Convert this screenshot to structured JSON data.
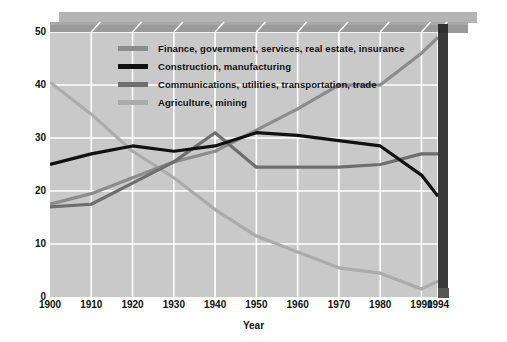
{
  "chart_data": {
    "type": "line",
    "title": "",
    "xlabel": "Year",
    "ylabel": "Percentage of U.S. work force",
    "xlim": [
      1900,
      1994
    ],
    "ylim": [
      0,
      50
    ],
    "grid": true,
    "legend_position": "upper-left-inside",
    "x_tick_labels": [
      "1900",
      "1910",
      "1920",
      "1930",
      "1940",
      "1950",
      "1960",
      "1970",
      "1980",
      "1990",
      "1994"
    ],
    "x_tick_values": [
      1900,
      1910,
      1920,
      1930,
      1940,
      1950,
      1960,
      1970,
      1980,
      1990,
      1994
    ],
    "y_tick_labels": [
      "0",
      "10",
      "20",
      "30",
      "40",
      "50"
    ],
    "y_tick_values": [
      0,
      10,
      20,
      30,
      40,
      50
    ],
    "x": [
      1900,
      1910,
      1920,
      1930,
      1940,
      1950,
      1960,
      1970,
      1980,
      1990,
      1994
    ],
    "series": [
      {
        "name": "Finance, government, services, real estate, insurance",
        "color": "#8c8c8c",
        "values": [
          17.5,
          19.5,
          22.5,
          25.5,
          27.5,
          31.5,
          35.5,
          40.0,
          40.0,
          46.0,
          49.0
        ]
      },
      {
        "name": "Construction, manufacturing",
        "color": "#111111",
        "values": [
          25.0,
          27.0,
          28.5,
          27.5,
          28.5,
          31.0,
          30.5,
          29.5,
          28.5,
          23.0,
          19.0
        ]
      },
      {
        "name": "Communications, utilities, transportation, trade",
        "color": "#6e6e6e",
        "values": [
          17.0,
          17.5,
          21.5,
          25.5,
          31.0,
          24.5,
          24.5,
          24.5,
          25.0,
          27.0,
          27.0
        ]
      },
      {
        "name": "Agriculture, mining",
        "color": "#ababab",
        "values": [
          40.5,
          34.5,
          27.5,
          22.5,
          16.5,
          11.5,
          8.5,
          5.5,
          4.5,
          1.5,
          3.0
        ]
      }
    ]
  },
  "legend": {
    "items": [
      {
        "label": "Finance, government, services, real estate, insurance",
        "color": "#8c8c8c"
      },
      {
        "label": "Construction, manufacturing",
        "color": "#111111"
      },
      {
        "label": "Communications, utilities, transportation, trade",
        "color": "#6e6e6e"
      },
      {
        "label": "Agriculture, mining",
        "color": "#ababab"
      }
    ]
  },
  "axes": {
    "y_title": "Percentage of U.S. work force",
    "x_title": "Year"
  },
  "colors": {
    "panel_background": "#c9c9c9",
    "gridline": "#ffffff",
    "top_face": "#9a9a9a",
    "top_shadow": "#b4b4b4",
    "right_wall": "#3a3a3a",
    "text": "#111111"
  }
}
